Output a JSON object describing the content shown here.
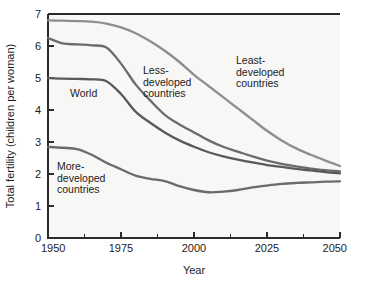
{
  "chart_data": {
    "type": "line",
    "title": "",
    "xlabel": "Year",
    "ylabel": "Total fertility (children per woman)",
    "xlim": [
      1950,
      2050
    ],
    "ylim": [
      0,
      7
    ],
    "grid": false,
    "legend_position": "inline-annotations",
    "xticks": [
      1950,
      1975,
      2000,
      2025,
      2050
    ],
    "xtick_labels": [
      "1950",
      "1975",
      "2000",
      "2025",
      "2050"
    ],
    "xminorticks": [
      1962.5,
      1987.5,
      2012.5,
      2037.5
    ],
    "yticks": [
      0,
      1,
      2,
      3,
      4,
      5,
      6,
      7
    ],
    "ytick_labels": [
      "0",
      "1",
      "2",
      "3",
      "4",
      "5",
      "6",
      "7"
    ],
    "x": [
      1950,
      1955,
      1960,
      1965,
      1970,
      1975,
      1980,
      1985,
      1990,
      1995,
      2000,
      2005,
      2010,
      2015,
      2020,
      2025,
      2030,
      2035,
      2040,
      2045,
      2050
    ],
    "series": [
      {
        "name": "Least-developed countries",
        "color": "#8d8d8d",
        "width": 2.3,
        "values": [
          6.8,
          6.79,
          6.78,
          6.76,
          6.7,
          6.58,
          6.4,
          6.15,
          5.85,
          5.5,
          5.1,
          4.75,
          4.4,
          4.05,
          3.7,
          3.35,
          3.05,
          2.8,
          2.6,
          2.42,
          2.25
        ]
      },
      {
        "name": "Less-developed countries",
        "color": "#6b6b6b",
        "width": 2.3,
        "values": [
          6.25,
          6.08,
          6.05,
          6.02,
          5.95,
          5.45,
          4.8,
          4.3,
          3.85,
          3.55,
          3.3,
          3.05,
          2.85,
          2.7,
          2.55,
          2.42,
          2.32,
          2.24,
          2.17,
          2.12,
          2.08
        ]
      },
      {
        "name": "World",
        "color": "#595959",
        "width": 2.3,
        "values": [
          5.0,
          4.98,
          4.97,
          4.96,
          4.9,
          4.5,
          3.95,
          3.6,
          3.3,
          3.05,
          2.85,
          2.68,
          2.55,
          2.45,
          2.36,
          2.28,
          2.22,
          2.16,
          2.11,
          2.06,
          2.02
        ]
      },
      {
        "name": "More-developed countries",
        "color": "#6b6b6b",
        "width": 2.3,
        "values": [
          2.85,
          2.82,
          2.78,
          2.6,
          2.35,
          2.15,
          1.95,
          1.85,
          1.78,
          1.62,
          1.5,
          1.43,
          1.45,
          1.5,
          1.58,
          1.64,
          1.69,
          1.72,
          1.74,
          1.76,
          1.77
        ]
      }
    ],
    "annotations": [
      {
        "name": "world-label",
        "lines": [
          "World"
        ],
        "x_px": 70,
        "y_px": 97
      },
      {
        "name": "less-developed-label",
        "lines": [
          "Less-",
          "developed",
          "countries"
        ],
        "x_px": 143,
        "y_px": 74
      },
      {
        "name": "least-developed-label",
        "lines": [
          "Least-",
          "developed",
          "countries"
        ],
        "x_px": 236,
        "y_px": 64
      },
      {
        "name": "more-developed-label",
        "lines": [
          "More-",
          "developed",
          "countries"
        ],
        "x_px": 57,
        "y_px": 170
      }
    ]
  },
  "colors": {
    "plot_background": "#f7f7f5",
    "page_background": "#ffffff",
    "axis": "#2b2b2b",
    "text": "#1c1c1c"
  }
}
